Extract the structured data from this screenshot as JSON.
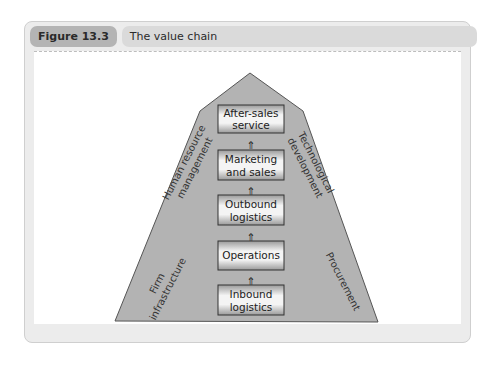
{
  "figure": {
    "label": "Figure 13.3",
    "title": "The value chain"
  },
  "diagram": {
    "shape_color": "#b3b3b3",
    "box_border_color": "#333333",
    "primary_activities": [
      {
        "line1": "After-sales",
        "line2": "service"
      },
      {
        "line1": "Marketing",
        "line2": "and sales"
      },
      {
        "line1": "Outbound",
        "line2": "logistics"
      },
      {
        "line1": "Operations",
        "line2": ""
      },
      {
        "line1": "Inbound",
        "line2": "logistics"
      }
    ],
    "support_activities": {
      "firm_infrastructure": {
        "line1": "Firm",
        "line2": "infrastructure"
      },
      "human_resource_management": {
        "line1": "Human resource",
        "line2": "management"
      },
      "technological_development": {
        "line1": "Technological",
        "line2": "development"
      },
      "procurement": {
        "line1": "Procurement"
      }
    },
    "arrow_glyph": "⇑"
  }
}
